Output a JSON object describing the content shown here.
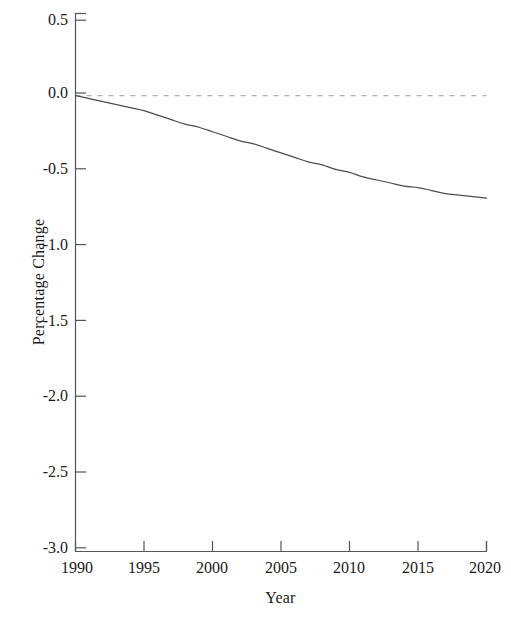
{
  "chart_data": {
    "type": "line",
    "title": "",
    "xlabel": "Year",
    "ylabel": "Percentage Change",
    "xlim": [
      1990,
      2020
    ],
    "ylim": [
      -3.0,
      0.5
    ],
    "xticks": [
      1990,
      1995,
      2000,
      2005,
      2010,
      2015,
      2020
    ],
    "xtick_labels": [
      "1990",
      "1995",
      "2000",
      "2005",
      "2010",
      "2015",
      "2020"
    ],
    "yticks": [
      0.5,
      0.0,
      -0.5,
      -1.0,
      -1.5,
      -2.0,
      -2.5,
      -3.0
    ],
    "ytick_labels": [
      "0.5",
      "0.0",
      "-0.5",
      "-1.0",
      "-1.5",
      "-2.0",
      "-2.5",
      "-3.0"
    ],
    "grid": false,
    "legend": "none",
    "series": [
      {
        "name": "Percentage Change",
        "style": "solid",
        "color": "#4d4d4d",
        "x": [
          1990,
          1991,
          1992,
          1993,
          1994,
          1995,
          1996,
          1997,
          1998,
          1999,
          2000,
          2001,
          2002,
          2003,
          2004,
          2005,
          2006,
          2007,
          2008,
          2009,
          2010,
          2011,
          2012,
          2013,
          2014,
          2015,
          2016,
          2017,
          2018,
          2019,
          2020
        ],
        "values": [
          0.0,
          -0.02,
          -0.04,
          -0.06,
          -0.08,
          -0.1,
          -0.13,
          -0.16,
          -0.19,
          -0.21,
          -0.24,
          -0.27,
          -0.3,
          -0.32,
          -0.35,
          -0.38,
          -0.41,
          -0.44,
          -0.46,
          -0.49,
          -0.51,
          -0.54,
          -0.56,
          -0.58,
          -0.6,
          -0.61,
          -0.63,
          -0.65,
          -0.66,
          -0.67,
          -0.68
        ]
      },
      {
        "name": "Zero reference",
        "style": "dashed",
        "color": "#b0b0b0",
        "x": [
          1990,
          2020
        ],
        "values": [
          0.0,
          0.0
        ]
      }
    ]
  },
  "axes": {
    "frame_color": "#555555",
    "background": "#ffffff"
  }
}
